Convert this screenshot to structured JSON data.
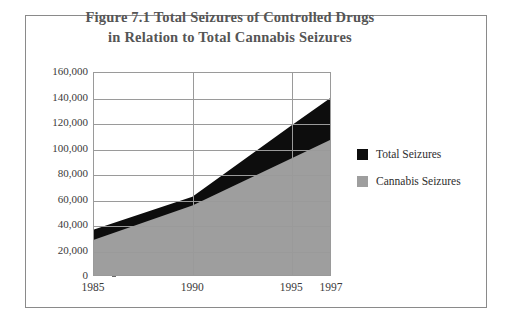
{
  "figure": {
    "title_line1": "Figure 7.1 Total Seizures of Controlled Drugs",
    "title_line2": "in Relation to Total Cannabis Seizures"
  },
  "colors": {
    "total_seizures": "#0d0d0d",
    "cannabis_seizures": "#9e9e9e",
    "gridline": "#9a9a9a",
    "frame": "#8a8a8a",
    "title_text": "#555555",
    "axis_text": "#3a3a3a"
  },
  "legend": {
    "items": [
      {
        "label": "Total Seizures",
        "color": "#0d0d0d",
        "swatch_name": "legend-swatch-total-seizures"
      },
      {
        "label": "Cannabis Seizures",
        "color": "#9e9e9e",
        "swatch_name": "legend-swatch-cannabis-seizures"
      }
    ]
  },
  "chart_data": {
    "type": "area",
    "title": "Figure 7.1 Total Seizures of Controlled Drugs in Relation to Total Cannabis Seizures",
    "xlabel": "",
    "ylabel": "",
    "x": [
      1985,
      1990,
      1995,
      1997
    ],
    "categories": [
      "1985",
      "1990",
      "1995",
      "1997"
    ],
    "xlim": [
      1985,
      1997
    ],
    "ylim": [
      0,
      160000
    ],
    "ytick_labels": [
      "160,000",
      "140,000",
      "120,000",
      "100,000",
      "80,000",
      "60,000",
      "40,000",
      "20,000",
      "0"
    ],
    "ytick_values": [
      160000,
      140000,
      120000,
      100000,
      80000,
      60000,
      40000,
      20000,
      0
    ],
    "xtick_labels": [
      "1985",
      "1990",
      "1995",
      "1997"
    ],
    "grid": true,
    "legend_position": "right",
    "stacked": false,
    "series": [
      {
        "name": "Total Seizures",
        "color": "#0d0d0d",
        "values": [
          36000,
          62000,
          118000,
          140000
        ]
      },
      {
        "name": "Cannabis Seizures",
        "color": "#9e9e9e",
        "values": [
          28000,
          55000,
          92000,
          107000
        ]
      }
    ]
  }
}
